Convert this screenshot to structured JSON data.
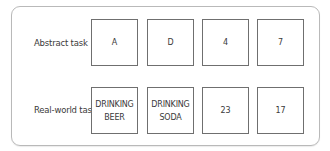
{
  "rows": [
    {
      "label": "Abstract task",
      "cards": [
        {
          "line1": "A",
          "line2": ""
        },
        {
          "line1": "D",
          "line2": ""
        },
        {
          "line1": "4",
          "line2": ""
        },
        {
          "line1": "7",
          "line2": ""
        }
      ]
    },
    {
      "label": "Real-world task",
      "cards": [
        {
          "line1": "DRINKING",
          "line2": "BEER"
        },
        {
          "line1": "DRINKING",
          "line2": "SODA"
        },
        {
          "line1": "23",
          "line2": ""
        },
        {
          "line1": "17",
          "line2": ""
        }
      ]
    }
  ],
  "colors": {
    "panel_border": "#b9b9b9",
    "card_border": "#6f6f6f",
    "text": "#3a3a3a"
  }
}
